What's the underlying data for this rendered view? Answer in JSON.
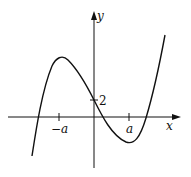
{
  "diagram": {
    "type": "cubic function graph",
    "axes": {
      "x_label": "x",
      "y_label": "y"
    },
    "ticks": {
      "neg_a": "−a",
      "pos_a": "a",
      "y_intercept": "2"
    },
    "curve": {
      "description": "cubic with local max at x=-a, local min at x=a, y-intercept 2",
      "local_max_x": "-a",
      "local_min_x": "a",
      "y_intercept": 2
    },
    "colors": {
      "stroke": "#111111",
      "background": "#ffffff"
    }
  }
}
